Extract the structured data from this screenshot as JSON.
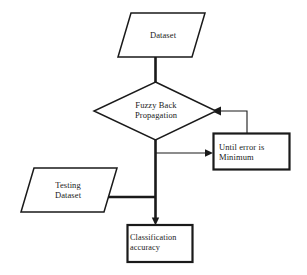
{
  "diagram": {
    "type": "flowchart",
    "background_color": "#ffffff",
    "stroke_color": "#1a1a1a",
    "nodes": {
      "dataset": {
        "label": "Dataset",
        "shape": "parallelogram",
        "role": "input-data"
      },
      "fuzzy_back_propagation": {
        "label": "Fuzzy Back\nPropagation",
        "shape": "diamond",
        "role": "process-decision"
      },
      "until_error_minimum": {
        "label": "Until error is\nMinimum",
        "shape": "rectangle",
        "role": "loop-condition"
      },
      "testing_dataset": {
        "label": "Testing\nDataset",
        "shape": "parallelogram",
        "role": "input-data"
      },
      "classification_accuracy": {
        "label": "Classification\naccuracy",
        "shape": "rectangle",
        "role": "output-result"
      }
    },
    "edges": [
      {
        "from": "dataset",
        "to": "fuzzy_back_propagation",
        "style": "thick-line",
        "arrowhead": false
      },
      {
        "from": "fuzzy_back_propagation",
        "to": "until_error_minimum",
        "style": "thin-line",
        "arrowhead": true
      },
      {
        "from": "until_error_minimum",
        "to": "fuzzy_back_propagation",
        "style": "thin-line-feedback",
        "arrowhead": true
      },
      {
        "from": "testing_dataset",
        "to": "classification_accuracy",
        "style": "thick-line",
        "arrowhead": false
      },
      {
        "from": "fuzzy_back_propagation",
        "to": "classification_accuracy",
        "style": "thick-line",
        "arrowhead": true
      }
    ]
  }
}
